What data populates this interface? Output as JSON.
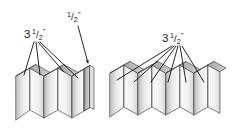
{
  "figure": {
    "background_color": "#ffffff",
    "line_color": "#4a4a4a",
    "leader_color": "#000000",
    "text_color": "#1a1a1a",
    "panel_fill_light": "#ffffff",
    "panel_fill_shade": "#c9c9c9",
    "panel_fill_dark": "#9a9a9a"
  },
  "callouts": [
    {
      "id": "left-width",
      "whole": "3",
      "numerator": "1",
      "slash": "/",
      "denominator": "2",
      "unit": "\"",
      "full_text": "3 1/2\"",
      "leader_count": 4,
      "target": "left-assembly-panel-faces"
    },
    {
      "id": "edge-thickness",
      "whole": "",
      "numerator": "1",
      "slash": "/",
      "denominator": "2",
      "unit": "\"",
      "full_text": "1/2\"",
      "leader_count": 1,
      "target": "left-assembly-end-edge"
    },
    {
      "id": "right-width",
      "whole": "3",
      "numerator": "1",
      "slash": "/",
      "denominator": "2",
      "unit": "\"",
      "full_text": "3 1/2\"",
      "leader_count": 6,
      "target": "right-assembly-panel-faces"
    }
  ],
  "assemblies": [
    {
      "id": "left-assembly",
      "label": "left-accordion-panels",
      "panel_count": 8,
      "fold_type": "accordion",
      "has_end_cap_edge": true
    },
    {
      "id": "right-assembly",
      "label": "right-accordion-panels",
      "panel_count": 10,
      "fold_type": "accordion",
      "has_end_cap_edge": false
    }
  ]
}
